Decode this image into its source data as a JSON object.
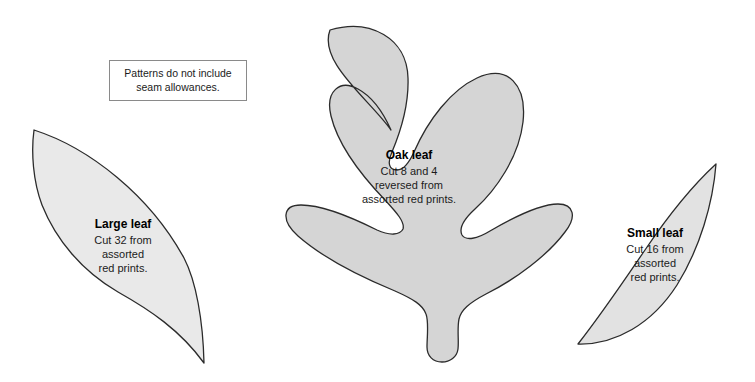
{
  "sheet": {
    "title": "Leaf appliqué pattern templates",
    "background_color": "#ffffff",
    "outline_color": "#2b2b2b"
  },
  "note": {
    "name": "seam-allowance-note",
    "line1": "Patterns do not include",
    "line2": "seam allowances.",
    "border_color": "#8a8a8a"
  },
  "shapes": [
    {
      "id": "large-leaf",
      "name": "Large leaf",
      "fill": "#e9e9e9",
      "stroke": "#2b2b2b",
      "label": {
        "title": "Large leaf",
        "lines": [
          "Cut 32 from",
          "assorted",
          "red prints."
        ]
      }
    },
    {
      "id": "oak-leaf",
      "name": "Oak leaf",
      "fill": "#d5d5d5",
      "stroke": "#2b2b2b",
      "label": {
        "title": "Oak leaf",
        "lines": [
          "Cut 8 and 4",
          "reversed from",
          "assorted red prints."
        ]
      }
    },
    {
      "id": "small-leaf",
      "name": "Small leaf",
      "fill": "#e2e2e2",
      "stroke": "#2b2b2b",
      "label": {
        "title": "Small leaf",
        "lines": [
          "Cut 16 from",
          "assorted",
          "red prints."
        ]
      }
    }
  ]
}
